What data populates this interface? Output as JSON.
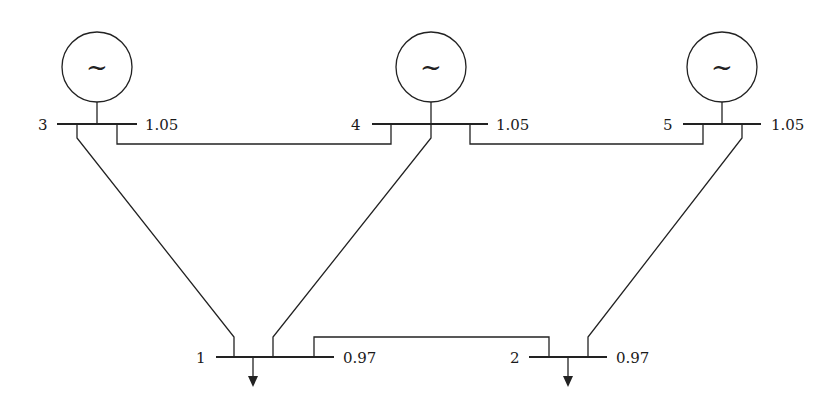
{
  "diagram": {
    "type": "five-bus power system one-line diagram",
    "buses": [
      {
        "id": "1",
        "label": "1",
        "voltage": "0.97",
        "type": "load",
        "load_arrow": true
      },
      {
        "id": "2",
        "label": "2",
        "voltage": "0.97",
        "type": "load",
        "load_arrow": true
      },
      {
        "id": "3",
        "label": "3",
        "voltage": "1.05",
        "type": "generator",
        "generator_symbol": "~"
      },
      {
        "id": "4",
        "label": "4",
        "voltage": "1.05",
        "type": "generator",
        "generator_symbol": "~"
      },
      {
        "id": "5",
        "label": "5",
        "voltage": "1.05",
        "type": "generator",
        "generator_symbol": "~"
      }
    ],
    "lines": [
      {
        "from": "3",
        "to": "1"
      },
      {
        "from": "3",
        "to": "4"
      },
      {
        "from": "4",
        "to": "1"
      },
      {
        "from": "4",
        "to": "5"
      },
      {
        "from": "5",
        "to": "2"
      },
      {
        "from": "1",
        "to": "2"
      }
    ]
  }
}
